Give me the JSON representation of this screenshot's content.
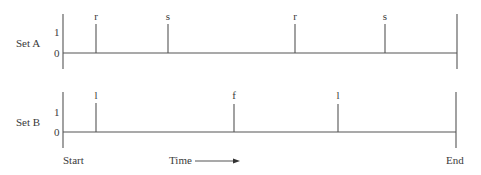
{
  "diagram": {
    "x_axis": {
      "start_label": "Start",
      "end_label": "End",
      "direction_label": "Time"
    },
    "y_tick_labels": [
      "0",
      "1"
    ],
    "rows": [
      {
        "name": "Set A",
        "events": [
          {
            "label": "r",
            "x": 96
          },
          {
            "label": "s",
            "x": 168
          },
          {
            "label": "r",
            "x": 295
          },
          {
            "label": "s",
            "x": 385
          }
        ]
      },
      {
        "name": "Set B",
        "events": [
          {
            "label": "l",
            "x": 96
          },
          {
            "label": "f",
            "x": 234
          },
          {
            "label": "l",
            "x": 338
          }
        ]
      }
    ]
  }
}
